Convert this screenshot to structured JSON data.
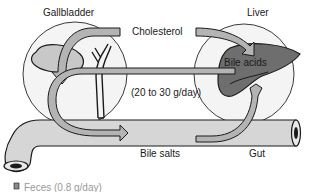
{
  "diagram": {
    "type": "enterohepatic-circulation",
    "labels": {
      "gallbladder": "Gallbladder",
      "liver": "Liver",
      "cholesterol": "Cholesterol",
      "bile_acids": "Bile acids",
      "rate": "(20 to 30 g/day)",
      "bile_salts": "Bile salts",
      "gut": "Gut",
      "feces": "Feces (0.8 g/day)"
    },
    "colors": {
      "arrow_fill": "#b4b4b4",
      "organ_fill": "#7a7a7a",
      "gut_fill": "#d6d6d6",
      "outline": "#1a1a1a",
      "circle": "#3a3a3a"
    }
  }
}
